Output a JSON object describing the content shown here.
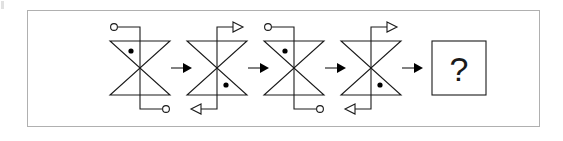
{
  "puzzle": {
    "type": "visual-sequence-reasoning",
    "prompt_symbol": "?",
    "frame": {
      "x": 27,
      "y": 10,
      "width": 513,
      "height": 117,
      "border_color": "#b0b0b0"
    },
    "ink_color": "#1a1a1a",
    "background_color": "#ffffff",
    "step_count": 4,
    "answer_slot_index": 4,
    "figure_geometry": {
      "half_width": 30,
      "half_height": 27,
      "stub_length": 28,
      "stub_offset": 22,
      "dot_radius": 2.6,
      "terminal_radius": 3.4,
      "note": "bowtie = two triangles meeting at a center point; a vertical line passes through the centre and turns horizontally at top and bottom"
    },
    "figures": [
      {
        "index": 1,
        "name": "bowtie-figure-1",
        "cx": 140,
        "cy": 68,
        "dot_triangle": "upper",
        "dot_side": "left",
        "top_terminal": "circle",
        "top_direction": "left",
        "bottom_terminal": "circle",
        "bottom_direction": "right",
        "description": "dot in upper triangle left of axis; open circle leads at top-left and bottom-right"
      },
      {
        "index": 2,
        "name": "bowtie-figure-2",
        "cx": 217,
        "cy": 68,
        "dot_triangle": "lower",
        "dot_side": "right",
        "top_terminal": "arrowhead",
        "top_direction": "right",
        "bottom_terminal": "arrowhead",
        "bottom_direction": "left",
        "description": "dot in lower triangle right of axis; hollow arrowheads exit right at top and left at bottom"
      },
      {
        "index": 3,
        "name": "bowtie-figure-3",
        "cx": 294,
        "cy": 68,
        "dot_triangle": "upper",
        "dot_side": "left",
        "top_terminal": "circle",
        "top_direction": "left",
        "bottom_terminal": "circle",
        "bottom_direction": "right",
        "description": "identical to figure 1"
      },
      {
        "index": 4,
        "name": "bowtie-figure-4",
        "cx": 371,
        "cy": 68,
        "dot_triangle": "lower",
        "dot_side": "right",
        "top_terminal": "arrowhead",
        "top_direction": "right",
        "bottom_terminal": "arrowhead",
        "bottom_direction": "left",
        "description": "identical to figure 2"
      }
    ],
    "connectors": [
      {
        "index": 1,
        "name": "sequence-arrow-1",
        "x": 178,
        "y": 68,
        "style": "solid",
        "direction": "right"
      },
      {
        "index": 2,
        "name": "sequence-arrow-2",
        "x": 255,
        "y": 68,
        "style": "solid",
        "direction": "right"
      },
      {
        "index": 3,
        "name": "sequence-arrow-3",
        "x": 332,
        "y": 68,
        "style": "solid",
        "direction": "right"
      },
      {
        "index": 4,
        "name": "sequence-arrow-4",
        "x": 409,
        "y": 68,
        "style": "solid",
        "direction": "right"
      }
    ],
    "answer_box": {
      "name": "answer-box",
      "x": 432,
      "y": 41,
      "width": 54,
      "height": 54,
      "label": "?"
    }
  }
}
